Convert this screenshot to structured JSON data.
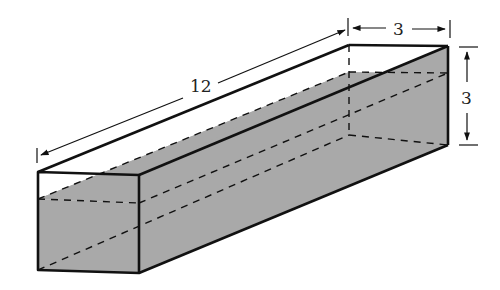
{
  "figure": {
    "type": "rectangular prism (tank) partially filled with liquid",
    "dimensions": {
      "length": {
        "label": "12",
        "value": 12
      },
      "width": {
        "label": "3",
        "value": 3
      },
      "height": {
        "label": "3",
        "value": 3
      }
    },
    "colors": {
      "stroke": "#111111",
      "liquid_fill": "#a9a9a9",
      "background": "#ffffff"
    },
    "line_styles": {
      "visible_edges": "solid thick",
      "hidden_edges": "dashed",
      "dimension_lines": "thin with arrows"
    }
  }
}
